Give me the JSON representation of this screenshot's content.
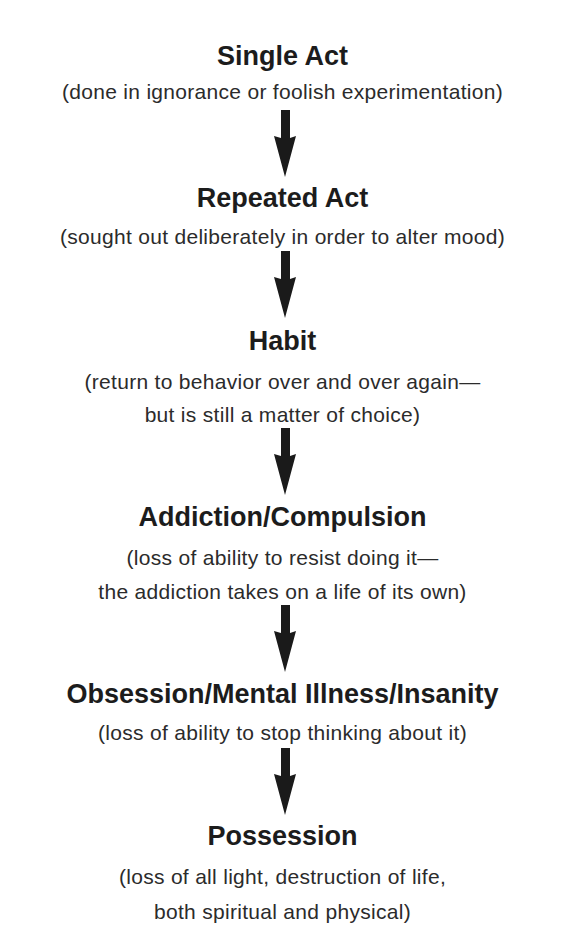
{
  "diagram": {
    "type": "vertical-flow",
    "stages": [
      {
        "title": "Single Act",
        "description_lines": [
          "(done in ignorance or foolish experimentation)"
        ]
      },
      {
        "title": "Repeated Act",
        "description_lines": [
          "(sought out deliberately in order to alter mood)"
        ]
      },
      {
        "title": "Habit",
        "description_lines": [
          "(return to behavior over and over again—",
          "but is still a matter of choice)"
        ]
      },
      {
        "title": "Addiction/Compulsion",
        "description_lines": [
          "(loss of ability to resist doing it—",
          "the addiction takes on a life of its own)"
        ]
      },
      {
        "title": "Obsession/Mental Illness/Insanity",
        "description_lines": [
          "(loss of ability to stop thinking about it)"
        ]
      },
      {
        "title": "Possession",
        "description_lines": [
          "(loss of all light, destruction of life,",
          "both spiritual and physical)"
        ]
      }
    ],
    "connectors": [
      {
        "from": "Single Act",
        "to": "Repeated Act",
        "icon": "arrow-down-icon"
      },
      {
        "from": "Repeated Act",
        "to": "Habit",
        "icon": "arrow-down-icon"
      },
      {
        "from": "Habit",
        "to": "Addiction/Compulsion",
        "icon": "arrow-down-icon"
      },
      {
        "from": "Addiction/Compulsion",
        "to": "Obsession/Mental Illness/Insanity",
        "icon": "arrow-down-icon"
      },
      {
        "from": "Obsession/Mental Illness/Insanity",
        "to": "Possession",
        "icon": "arrow-down-icon"
      }
    ],
    "colors": {
      "background": "#ffffff",
      "title_text": "#1c1c1c",
      "description_text": "#2b2b2b",
      "arrow": "#1a1a1a"
    }
  }
}
